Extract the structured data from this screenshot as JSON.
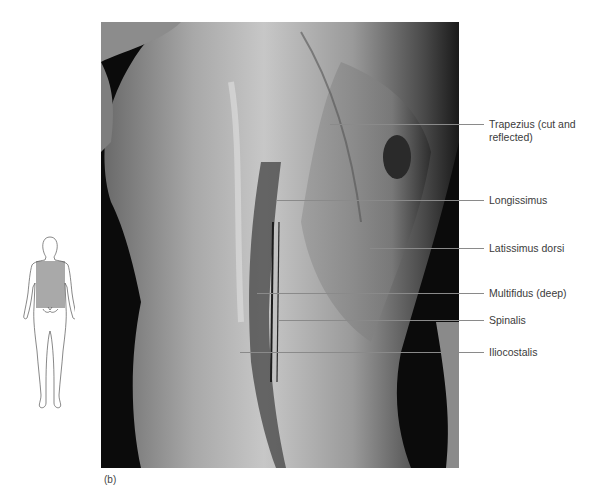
{
  "figure": {
    "panel_label": "(b)",
    "photo_description": "Cadaver dissection photograph of the back showing deep back muscles",
    "orientation_diagram": {
      "description": "Posterior view body outline with shaded back region",
      "highlight_color": "#a9a9a9"
    },
    "labels": [
      {
        "id": "trapezius",
        "text_line1": "Trapezius (cut and",
        "text_line2": "reflected)"
      },
      {
        "id": "longissimus",
        "text_line1": "Longissimus"
      },
      {
        "id": "latissimus",
        "text_line1": "Latissimus dorsi"
      },
      {
        "id": "multifidus",
        "text_line1": "Multifidus (deep)"
      },
      {
        "id": "spinalis",
        "text_line1": "Spinalis"
      },
      {
        "id": "iliocostalis",
        "text_line1": "Iliocostalis"
      }
    ]
  }
}
